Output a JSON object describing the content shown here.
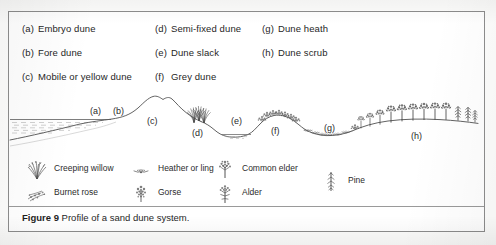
{
  "figure": {
    "caption_label": "Figure 9",
    "caption_text": " Profile of a sand dune system.",
    "border_color": "#8d8d8d",
    "ink_color": "#2a2a2a",
    "paper_color": "#ffffff"
  },
  "letter_key": {
    "columns": [
      {
        "items": [
          {
            "letter": "(a)",
            "label": "Embryo dune"
          },
          {
            "letter": "(b)",
            "label": "Fore dune"
          },
          {
            "letter": "(c)",
            "label": "Mobile or yellow dune"
          }
        ]
      },
      {
        "items": [
          {
            "letter": "(d)",
            "label": "Semi-fixed dune"
          },
          {
            "letter": "(e)",
            "label": "Dune slack"
          },
          {
            "letter": "(f)",
            "label": "Grey dune"
          }
        ]
      },
      {
        "items": [
          {
            "letter": "(g)",
            "label": "Dune heath"
          },
          {
            "letter": "(h)",
            "label": "Dune scrub"
          }
        ]
      }
    ]
  },
  "profile": {
    "zone_labels": [
      {
        "id": "a",
        "text": "(a)",
        "x": 82,
        "y": 26
      },
      {
        "id": "b",
        "text": "(b)",
        "x": 105,
        "y": 26
      },
      {
        "id": "c",
        "text": "(c)",
        "x": 138,
        "y": 35
      },
      {
        "id": "d",
        "text": "(d)",
        "x": 186,
        "y": 44
      },
      {
        "id": "e",
        "text": "(e)",
        "x": 225,
        "y": 33
      },
      {
        "id": "f",
        "text": "(f)",
        "x": 265,
        "y": 42
      },
      {
        "id": "g",
        "text": "(g)",
        "x": 318,
        "y": 40
      },
      {
        "id": "h",
        "text": "(h)",
        "x": 405,
        "y": 47
      }
    ],
    "features": [
      "sea-with-hatching",
      "beach-slope",
      "embryo-dune",
      "fore-dune",
      "mobile-yellow-dune-peak",
      "marram-grass-tuft",
      "dune-slack-pool",
      "grey-dune-scrub",
      "dune-heath-hollow",
      "dune-scrub-trees",
      "pine-trees"
    ]
  },
  "plant_key": {
    "items": [
      {
        "icon": "creeping-willow-icon",
        "label": "Creeping willow",
        "x": 16,
        "y": 2
      },
      {
        "icon": "burnet-rose-icon",
        "label": "Burnet rose",
        "x": 16,
        "y": 26
      },
      {
        "icon": "heather-or-ling-icon",
        "label": "Heather or ling",
        "x": 120,
        "y": 2
      },
      {
        "icon": "gorse-icon",
        "label": "Gorse",
        "x": 120,
        "y": 26
      },
      {
        "icon": "common-elder-icon",
        "label": "Common elder",
        "x": 204,
        "y": 2
      },
      {
        "icon": "alder-icon",
        "label": "Alder",
        "x": 204,
        "y": 26
      },
      {
        "icon": "pine-icon",
        "label": "Pine",
        "x": 310,
        "y": 16
      }
    ]
  }
}
